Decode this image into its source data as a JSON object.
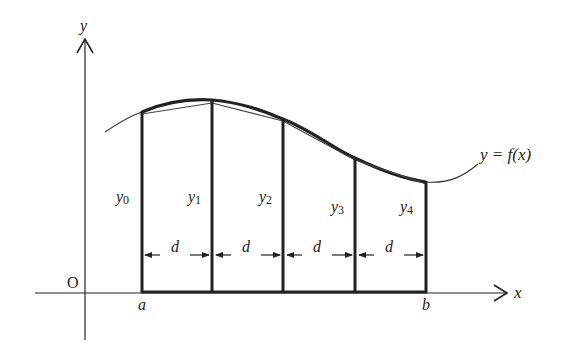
{
  "diagram": {
    "type": "trapezoidal-rule-figure",
    "axes": {
      "x_label": "x",
      "y_label": "y",
      "origin_label": "O"
    },
    "function_label": "y = f(x)",
    "interval": {
      "start_label": "a",
      "end_label": "b"
    },
    "ordinates": [
      {
        "label": "y",
        "sub": "0"
      },
      {
        "label": "y",
        "sub": "1"
      },
      {
        "label": "y",
        "sub": "2"
      },
      {
        "label": "y",
        "sub": "3"
      },
      {
        "label": "y",
        "sub": "4"
      }
    ],
    "strip_width_label": "d",
    "strip_count": 4,
    "colors": {
      "ink": "#222222",
      "background": "#ffffff"
    }
  }
}
